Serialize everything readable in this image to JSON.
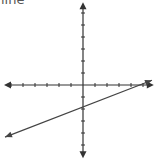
{
  "title": "line",
  "colors": {
    "axis": "#333333",
    "line": "#444444",
    "background": "#ffffff"
  },
  "chart_data": {
    "type": "line",
    "title": "line",
    "xlabel": "",
    "ylabel": "",
    "grid": false,
    "axis_ticks": {
      "x_negative": 6,
      "x_positive": 5,
      "y_positive": 6,
      "y_negative": 5
    },
    "series": [
      {
        "name": "line",
        "x": [
          -6,
          5.5
        ],
        "y": [
          -4.3,
          0.4
        ],
        "slope": 0.4,
        "y_intercept": -2,
        "x_intercept": 5
      }
    ],
    "xlim": [
      -6,
      6
    ],
    "ylim": [
      -6,
      6
    ]
  }
}
